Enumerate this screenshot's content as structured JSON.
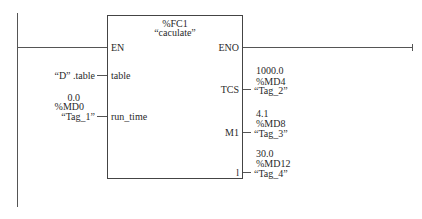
{
  "block": {
    "id": "%FC1",
    "name": "“caculate”"
  },
  "pins": {
    "inputs": [
      {
        "name": "EN"
      },
      {
        "name": "table"
      },
      {
        "name": "run_time"
      }
    ],
    "outputs": [
      {
        "name": "ENO"
      },
      {
        "name": "TCS"
      },
      {
        "name": "M1"
      },
      {
        "name": "l"
      }
    ]
  },
  "operands": {
    "table": {
      "symbol": "“D” .table"
    },
    "run_time": {
      "value": "0.0",
      "address": "%MD0",
      "symbol": "“Tag_1”"
    },
    "TCS": {
      "value": "1000.0",
      "address": "%MD4",
      "symbol": "“Tag_2”"
    },
    "M1": {
      "value": "4.1",
      "address": "%MD8",
      "symbol": "“Tag_3”"
    },
    "l": {
      "value": "30.0",
      "address": "%MD12",
      "symbol": "“Tag_4”"
    }
  },
  "colors": {
    "line": "#555555",
    "text": "#2a2a2a",
    "background": "#ffffff"
  }
}
